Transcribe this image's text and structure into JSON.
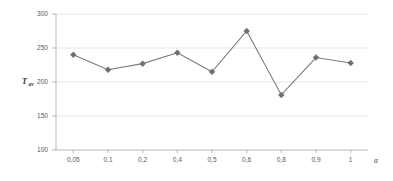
{
  "chart_data": {
    "type": "line",
    "title": "",
    "subtitle": "",
    "xlabel": "α",
    "ylabel": "Tav",
    "ylabel_base": "T",
    "ylabel_sub": "av",
    "categories": [
      "0,05",
      "0,1",
      "0,2",
      "0,4",
      "0,5",
      "0,6",
      "0,8",
      "0,9",
      "1"
    ],
    "values": [
      240,
      218,
      227,
      243,
      215,
      275,
      181,
      236,
      228
    ],
    "ylim": [
      100,
      300
    ],
    "yticks": [
      100,
      150,
      200,
      250,
      300
    ],
    "ytick_labels": [
      "100",
      "150",
      "200",
      "250",
      "300"
    ],
    "grid": "horizontal",
    "legend": "none",
    "series": [
      {
        "name": "Tav",
        "values": [
          240,
          218,
          227,
          243,
          215,
          275,
          181,
          236,
          228
        ],
        "line_color": "#7b7b7b",
        "marker_color": "#6e6e6e",
        "marker": "diamond"
      }
    ],
    "colors": {
      "line": "#7b7b7b",
      "marker": "#6e6e6e",
      "grid": "#d4d4d4",
      "axis": "#9a9a9a",
      "tick_text": "#5a5a5a",
      "background": "#ffffff"
    }
  }
}
